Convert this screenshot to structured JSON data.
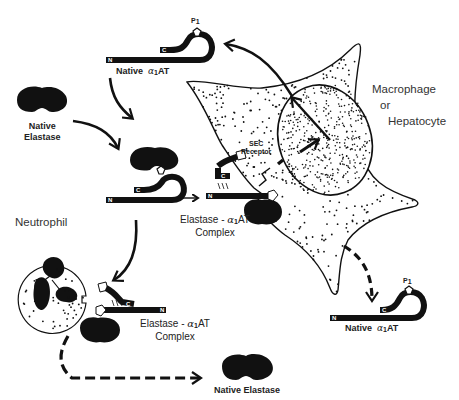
{
  "diagram": {
    "labels": {
      "native_a1at_top": {
        "word": "Native",
        "greek": "α",
        "sub": "1",
        "suffix": "AT"
      },
      "native_a1at_bottom": {
        "word": "Native",
        "greek": "α",
        "sub": "1",
        "suffix": "AT"
      },
      "native_elastase_left_line1": "Native",
      "native_elastase_left_line2": "Elastase",
      "native_elastase_bottom": "Native Elastase",
      "complex_center": {
        "line1_prefix": "Elastase - ",
        "greek": "α",
        "sub": "1",
        "suffix": "AT",
        "line2": "Complex"
      },
      "complex_bottom": {
        "line1_prefix": "Elastase - ",
        "greek": "α",
        "sub": "1",
        "suffix": "AT",
        "line2": "Complex"
      },
      "cell_type_line1": "Macrophage",
      "cell_type_line2": "or",
      "cell_type_line3": "Hepatocyte",
      "neutrophil": "Neutrophil",
      "receptor_line1": "SEC",
      "receptor_line2": "Receptor",
      "p1_letter": "P",
      "p1_sub": "1",
      "n_terminal": "N",
      "c_terminal": "C"
    },
    "colors": {
      "ink": "#111111",
      "background": "#ffffff",
      "text": "#333333"
    }
  }
}
